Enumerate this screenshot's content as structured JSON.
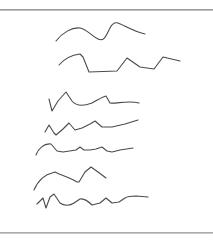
{
  "image": {
    "type": "handwriting-scribble-sample",
    "stroke_color": "#4a4a4a",
    "stroke_width": 1.1,
    "lines": [
      {
        "name": "scribble-line-1",
        "d": "M56 41 C62 33 72 27 80 28 C86 29 92 36 98 39 C104 42 106 36 110 28 C112 24 114 22 118 23 C124 25 132 31 145 34"
      },
      {
        "name": "scribble-line-2",
        "d": "M59 65 C64 59 72 55 80 54 L83 57 L89 72 L117 71 L127 58 L140 67 L154 69 L163 57 L180 61"
      },
      {
        "name": "scribble-line-3",
        "d": "M49 99 L52 111 L58 101 L66 92 L72 101 C76 106 84 106 92 103 C98 100 102 97 106 96 L110 103 C116 104 128 100 139 103"
      },
      {
        "name": "scribble-line-4",
        "d": "M45 132 L49 125 L54 133 L56 135 L63 129 L69 123 L75 130 L82 128 L90 124 L95 121 L102 127 L112 127 L125 124 L138 120"
      },
      {
        "name": "scribble-line-5",
        "d": "M36 155 C38 149 44 143 51 144 L57 151 L63 152 L76 150 L80 147 L84 150 L90 150 L96 149 L102 147 L107 151 L112 152 L120 150 L133 148"
      },
      {
        "name": "scribble-line-6",
        "d": "M34 190 C38 180 46 174 52 173 L55 172 L59 174 C64 176 72 179 77 182 L79 182 L85 172 L91 167 L98 172 L106 178"
      },
      {
        "name": "scribble-line-7",
        "d": "M37 204 L43 198 L46 208 L50 197 L54 194 L60 203 C64 206 70 206 74 203 L80 199 C84 198 88 201 92 205 L100 203 L106 198 L112 203 L119 202 L125 198 C128 196 132 196 136 196 L148 197"
      }
    ]
  },
  "frame": {
    "top_rule_color": "#8a8a8a",
    "bottom_rule_color": "#9a9a9a"
  },
  "caption": {
    "text": ""
  }
}
